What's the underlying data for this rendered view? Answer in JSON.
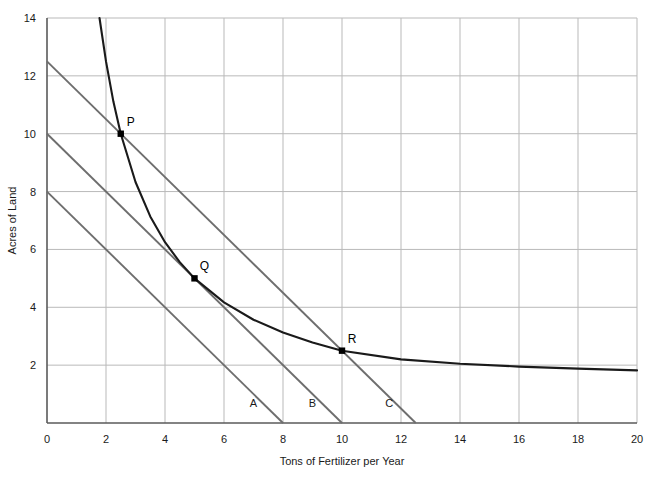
{
  "chart_data": {
    "type": "line",
    "title": "",
    "xlabel": "Tons of Fertilizer per Year",
    "ylabel": "Acres of Land",
    "xlim": [
      0,
      20
    ],
    "ylim": [
      0,
      14
    ],
    "xticks": [
      0,
      2,
      4,
      6,
      8,
      10,
      12,
      14,
      16,
      18,
      20
    ],
    "yticks": [
      2,
      4,
      6,
      8,
      10,
      12,
      14
    ],
    "xtick_labels": [
      "0",
      "2",
      "4",
      "6",
      "8",
      "10",
      "12",
      "14",
      "16",
      "18",
      "20"
    ],
    "ytick_labels": [
      "2",
      "4",
      "6",
      "8",
      "10",
      "12",
      "14"
    ],
    "grid": true,
    "legend": "none",
    "series": [
      {
        "name": "isoquant",
        "kind": "curve",
        "color": "#1a1a1a",
        "relation": "x*y = 25",
        "points": [
          {
            "x": 1.78,
            "y": 14.0
          },
          {
            "x": 2.0,
            "y": 12.5
          },
          {
            "x": 2.25,
            "y": 11.11
          },
          {
            "x": 2.5,
            "y": 10.0
          },
          {
            "x": 3.0,
            "y": 8.33
          },
          {
            "x": 3.5,
            "y": 7.14
          },
          {
            "x": 4.0,
            "y": 6.25
          },
          {
            "x": 4.5,
            "y": 5.56
          },
          {
            "x": 5.0,
            "y": 5.0
          },
          {
            "x": 6.0,
            "y": 4.17
          },
          {
            "x": 7.0,
            "y": 3.57
          },
          {
            "x": 8.0,
            "y": 3.13
          },
          {
            "x": 9.0,
            "y": 2.78
          },
          {
            "x": 10.0,
            "y": 2.5
          },
          {
            "x": 12.0,
            "y": 2.2
          },
          {
            "x": 14.0,
            "y": 2.05
          },
          {
            "x": 16.0,
            "y": 1.95
          },
          {
            "x": 18.0,
            "y": 1.88
          },
          {
            "x": 20.0,
            "y": 1.82
          }
        ]
      },
      {
        "name": "isocost-A",
        "kind": "line",
        "color": "#6e6e6e",
        "slope": -1,
        "y_intercept": 8,
        "x_intercept": 8,
        "from": {
          "x": 0,
          "y": 8
        },
        "to": {
          "x": 8,
          "y": 0
        },
        "label": "A"
      },
      {
        "name": "isocost-B",
        "kind": "line",
        "color": "#6e6e6e",
        "slope": -1,
        "y_intercept": 10,
        "x_intercept": 10,
        "from": {
          "x": 0,
          "y": 10
        },
        "to": {
          "x": 10,
          "y": 0
        },
        "label": "B"
      },
      {
        "name": "isocost-C",
        "kind": "line",
        "color": "#6e6e6e",
        "slope": -1,
        "y_intercept": 12.5,
        "x_intercept": 12.5,
        "from": {
          "x": 0,
          "y": 12.5
        },
        "to": {
          "x": 12.5,
          "y": 0
        },
        "label": "C"
      }
    ],
    "annotations": [
      {
        "name": "P",
        "label": "P",
        "x": 2.5,
        "y": 10.0,
        "marker": true,
        "label_dx": 10,
        "label_dy": -8
      },
      {
        "name": "Q",
        "label": "Q",
        "x": 5.0,
        "y": 5.0,
        "marker": true,
        "label_dx": 10,
        "label_dy": -8
      },
      {
        "name": "R",
        "label": "R",
        "x": 10.0,
        "y": 2.5,
        "marker": true,
        "label_dx": 10,
        "label_dy": -8
      }
    ],
    "line_labels": [
      {
        "name": "A",
        "label": "A",
        "x": 7.0,
        "y": 0.55
      },
      {
        "name": "B",
        "label": "B",
        "x": 9.0,
        "y": 0.55
      },
      {
        "name": "C",
        "label": "C",
        "x": 11.6,
        "y": 0.55
      }
    ]
  },
  "colors": {
    "background": "#ffffff",
    "grid": "#b9b9b9",
    "axis": "#5a5a5a",
    "curve": "#1a1a1a",
    "isocost": "#6e6e6e",
    "text": "#1a1a1a",
    "marker": "#000000"
  }
}
